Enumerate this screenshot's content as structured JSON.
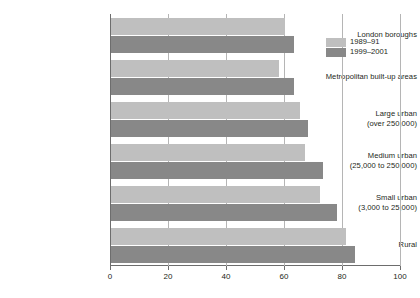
{
  "chart_data": {
    "type": "bar",
    "orientation": "horizontal",
    "title": "",
    "xlabel": "",
    "ylabel": "",
    "xlim": [
      0,
      100
    ],
    "xticks": [
      0,
      20,
      40,
      60,
      80,
      100
    ],
    "grid": true,
    "legend_position": "top-right",
    "categories": [
      "London boroughs",
      "Metropolitan built-up areas",
      "Large urban (over 250,000)",
      "Medium urban (25,000 to 250,000)",
      "Small urban (3,000 to 25,000)",
      "Rural"
    ],
    "category_lines": [
      {
        "line1": "London boroughs",
        "line2": ""
      },
      {
        "line1": "Metropolitan built-up areas",
        "line2": ""
      },
      {
        "line1": "Large urban",
        "line2": "(over 250,000)"
      },
      {
        "line1": "Medium urban",
        "line2": "(25,000 to 250,000)"
      },
      {
        "line1": "Small urban",
        "line2": "(3,000 to 25,000)"
      },
      {
        "line1": "Rural",
        "line2": ""
      }
    ],
    "series": [
      {
        "name": "1989–91",
        "color": "#bfbfbf",
        "values": [
          60,
          58,
          65,
          67,
          72,
          81
        ]
      },
      {
        "name": "1999–2001",
        "color": "#888888",
        "values": [
          63,
          63,
          68,
          73,
          78,
          84
        ]
      }
    ]
  },
  "legend": {
    "items": [
      {
        "label": "1989–91"
      },
      {
        "label": "1999–2001"
      }
    ]
  },
  "axis": {
    "tick_labels": [
      "0",
      "20",
      "40",
      "60",
      "80",
      "100"
    ]
  },
  "artifacts": {
    "clipped_top_text": ""
  }
}
